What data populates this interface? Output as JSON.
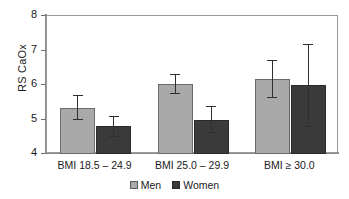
{
  "chart_data": {
    "type": "bar",
    "title": "",
    "subtitle": "",
    "xlabel": "",
    "ylabel": "RS CaOx",
    "ylim": [
      4,
      8
    ],
    "yticks": [
      "4",
      "5",
      "6",
      "7",
      "8"
    ],
    "grid": false,
    "legend_position": "bottom-center",
    "categories": [
      "BMI 18.5 – 24.9",
      "BMI 25.0 – 29.9",
      "BMI ≥ 30.0"
    ],
    "series": [
      {
        "name": "Men",
        "color": "#a9a9a9",
        "values": [
          5.33,
          6.02,
          6.17
        ],
        "error_low": [
          4.98,
          5.73,
          5.62
        ],
        "error_high": [
          5.72,
          6.31,
          6.73
        ],
        "caps_top": [
          true,
          true,
          true
        ],
        "caps_bottom": [
          true,
          true,
          true
        ]
      },
      {
        "name": "Women",
        "color": "#3a3a3a",
        "values": [
          4.8,
          5.0,
          6.0
        ],
        "error_low": [
          4.5,
          4.62,
          4.78
        ],
        "error_high": [
          5.1,
          5.4,
          7.2
        ],
        "caps_top": [
          true,
          true,
          true
        ],
        "caps_bottom": [
          true,
          true,
          true
        ]
      }
    ]
  },
  "legend": {
    "items": [
      {
        "label": "Men",
        "color": "#a9a9a9"
      },
      {
        "label": "Women",
        "color": "#3a3a3a"
      }
    ]
  },
  "axis": {
    "y_title": "RS CaOx"
  }
}
